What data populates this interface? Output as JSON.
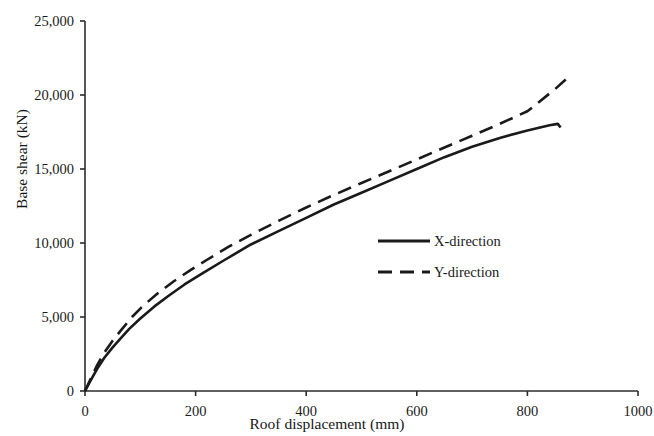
{
  "chart_data": {
    "type": "line",
    "title": "",
    "xlabel": "Roof displacement (mm)",
    "ylabel": "Base shear (kN)",
    "xlim": [
      0,
      1000
    ],
    "ylim": [
      0,
      25000
    ],
    "grid": false,
    "legend_position": "center-right-inside",
    "xticks": [
      "0",
      "200",
      "400",
      "600",
      "800",
      "1000"
    ],
    "xtick_values": [
      0,
      200,
      400,
      600,
      800,
      1000
    ],
    "yticks": [
      "0",
      "5,000",
      "10,000",
      "15,000",
      "20,000",
      "25,000"
    ],
    "ytick_values": [
      0,
      5000,
      10000,
      15000,
      20000,
      25000
    ],
    "series": [
      {
        "name": "X-direction",
        "style": "solid",
        "color": "#1a1a1a",
        "x": [
          0,
          10,
          22,
          35,
          50,
          62,
          80,
          100,
          125,
          150,
          180,
          210,
          250,
          300,
          350,
          400,
          450,
          500,
          550,
          600,
          650,
          700,
          750,
          800,
          840,
          855,
          860
        ],
        "y": [
          0,
          700,
          1500,
          2250,
          2950,
          3450,
          4200,
          4900,
          5700,
          6400,
          7200,
          7900,
          8800,
          9900,
          10800,
          11700,
          12600,
          13400,
          14200,
          15000,
          15800,
          16500,
          17100,
          17600,
          17950,
          18050,
          17800
        ]
      },
      {
        "name": "Y-direction",
        "style": "dashed",
        "color": "#1a1a1a",
        "x": [
          0,
          10,
          22,
          35,
          50,
          65,
          85,
          105,
          130,
          160,
          190,
          220,
          260,
          300,
          350,
          400,
          450,
          500,
          550,
          600,
          650,
          700,
          750,
          800,
          850,
          880
        ],
        "y": [
          0,
          800,
          1750,
          2600,
          3400,
          4100,
          5000,
          5750,
          6550,
          7400,
          8150,
          8850,
          9750,
          10550,
          11500,
          12400,
          13250,
          14050,
          14850,
          15650,
          16450,
          17250,
          18050,
          18900,
          20400,
          21400
        ]
      }
    ],
    "legend": [
      {
        "label": "X-direction",
        "style": "solid"
      },
      {
        "label": "Y-direction",
        "style": "dashed"
      }
    ]
  },
  "geometry": {
    "plot_left": 85,
    "plot_right": 638,
    "plot_top": 21,
    "plot_bottom": 391
  }
}
